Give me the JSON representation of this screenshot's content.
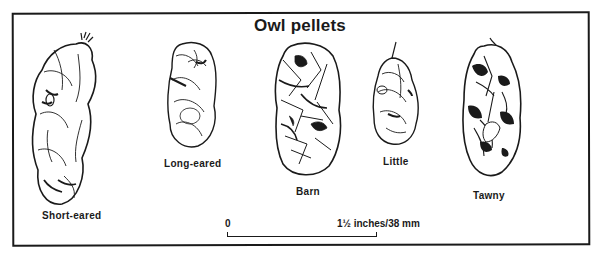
{
  "figure": {
    "title": "Owl pellets",
    "pellets": [
      {
        "name": "Short-eared",
        "icon": "short-eared-pellet-icon"
      },
      {
        "name": "Long-eared",
        "icon": "long-eared-pellet-icon"
      },
      {
        "name": "Barn",
        "icon": "barn-pellet-icon"
      },
      {
        "name": "Little",
        "icon": "little-pellet-icon"
      },
      {
        "name": "Tawny",
        "icon": "tawny-pellet-icon"
      }
    ],
    "scale": {
      "start_label": "0",
      "end_label": "1½ inches/38 mm"
    }
  },
  "colors": {
    "ink": "#1a1a1a",
    "background": "#ffffff"
  }
}
